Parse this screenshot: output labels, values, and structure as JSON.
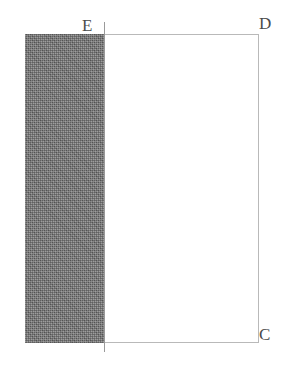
{
  "figure": {
    "type": "geometry-diagram",
    "canvas": {
      "width": 293,
      "height": 371,
      "background": "#ffffff"
    },
    "colors": {
      "shade_fill": "#6d6d6d",
      "outline": "#b9b9b9",
      "divider": "#9a9a9a",
      "label_text": "#4b4b4b",
      "page_background": "#ffffff"
    },
    "labels": [
      {
        "id": "E",
        "text": "E",
        "x": 82,
        "y": 17,
        "position": "above-divider-top"
      },
      {
        "id": "D",
        "text": "D",
        "x": 259,
        "y": 15,
        "position": "above-right-of-top-right-corner"
      },
      {
        "id": "C",
        "text": "C",
        "x": 259,
        "y": 326,
        "position": "below-right-of-bottom-right-corner"
      }
    ],
    "shapes": {
      "outer_rectangle": {
        "name": "outer-rectangle",
        "x": 25,
        "y": 34,
        "width": 234,
        "height": 309,
        "stroke": "#b9b9b9",
        "fill": "#ffffff"
      },
      "shaded_rectangle": {
        "name": "shaded-left-region",
        "x": 25,
        "y": 34,
        "width": 79,
        "height": 309,
        "fill": "#6d6d6d",
        "pattern": "fine-stipple"
      },
      "divider": {
        "name": "vertical-divider-line",
        "x": 104,
        "y_top": 22,
        "y_bottom": 352,
        "stroke": "#9a9a9a",
        "orientation": "vertical"
      }
    }
  }
}
